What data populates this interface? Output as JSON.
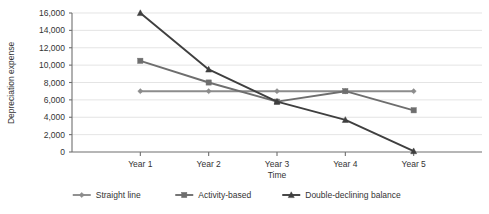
{
  "chart_data": {
    "type": "line",
    "title": "",
    "xlabel": "Time",
    "ylabel": "Depreciation expense",
    "categories": [
      "Year 1",
      "Year 2",
      "Year 3",
      "Year 4",
      "Year 5"
    ],
    "ylim": [
      0,
      16000
    ],
    "ytick_labels": [
      "0",
      "2,000",
      "4,000",
      "6,000",
      "8,000",
      "10,000",
      "12,000",
      "14,000",
      "16,000"
    ],
    "ytick_values": [
      0,
      2000,
      4000,
      6000,
      8000,
      10000,
      12000,
      14000,
      16000
    ],
    "grid": true,
    "legend_position": "bottom",
    "series": [
      {
        "name": "Straight line",
        "marker": "diamond",
        "color": "#8c8c8c",
        "values": [
          7000,
          7000,
          7000,
          7000,
          7000
        ]
      },
      {
        "name": "Activity-based",
        "marker": "square",
        "color": "#6e6e6e",
        "values": [
          10500,
          8000,
          5800,
          7000,
          4800
        ]
      },
      {
        "name": "Double-declining balance",
        "marker": "triangle",
        "color": "#3f3f3f",
        "values": [
          16000,
          9500,
          5800,
          3700,
          100
        ]
      }
    ]
  }
}
